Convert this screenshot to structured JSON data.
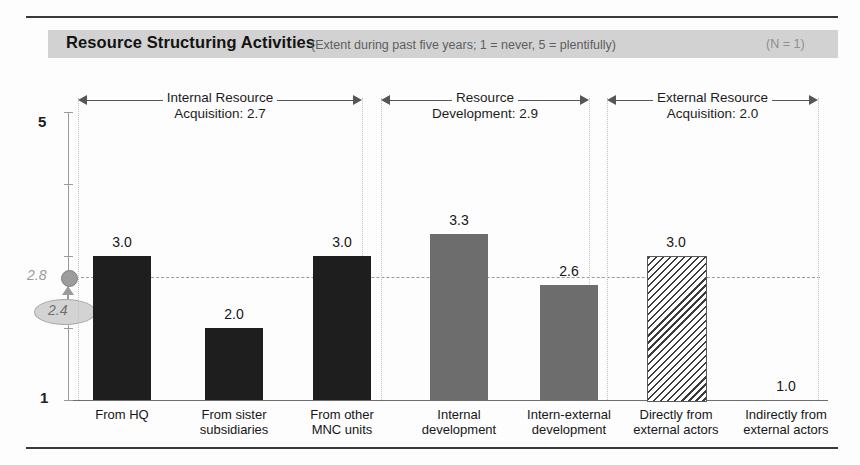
{
  "header": {
    "title": "Resource Structuring Activities",
    "subtitle": "(Extent during past five years; 1 = never, 5 = plentifully)",
    "sample": "(N = 1)"
  },
  "markers": {
    "reference_value": "2.8",
    "callout_value": "2.4"
  },
  "chart_data": {
    "type": "bar",
    "title": "Resource Structuring Activities",
    "subtitle": "(Extent during past five years; 1 = never, 5 = plentifully)",
    "xlabel": "",
    "ylabel": "",
    "ylim": [
      1,
      5
    ],
    "ytick_labels": [
      "1",
      "5"
    ],
    "grid": false,
    "legend": "none",
    "reference_line": 2.8,
    "categories": [
      "From HQ",
      "From sister subsidiaries",
      "From other MNC units",
      "Internal development",
      "Intern-external development",
      "Directly from external actors",
      "Indirectly from external actors"
    ],
    "values": [
      3.0,
      2.0,
      3.0,
      3.3,
      2.6,
      3.0,
      1.0
    ],
    "value_labels": [
      "3.0",
      "2.0",
      "3.0",
      "3.3",
      "2.6",
      "3.0",
      "1.0"
    ],
    "groups": [
      {
        "name": "Internal Resource Acquisition",
        "mean": "2.7",
        "line1": "Internal Resource",
        "line2": "Acquisition: 2.7",
        "indices": [
          0,
          1,
          2
        ],
        "fill": "solid"
      },
      {
        "name": "Resource Development",
        "mean": "2.9",
        "line1": "Resource",
        "line2": "Development: 2.9",
        "indices": [
          3,
          4
        ],
        "fill": "dots"
      },
      {
        "name": "External Resource Acquisition",
        "mean": "2.0",
        "line1": "External Resource",
        "line2": "Acquisition: 2.0",
        "indices": [
          5,
          6
        ],
        "fill": "hatch"
      }
    ]
  },
  "xlabels": [
    {
      "l1": "From HQ",
      "l2": ""
    },
    {
      "l1": "From sister",
      "l2": "subsidiaries"
    },
    {
      "l1": "From other",
      "l2": "MNC units"
    },
    {
      "l1": "Internal",
      "l2": "development"
    },
    {
      "l1": "Intern-external",
      "l2": "development"
    },
    {
      "l1": "Directly from",
      "l2": "external actors"
    },
    {
      "l1": "Indirectly from",
      "l2": "external actors"
    }
  ]
}
